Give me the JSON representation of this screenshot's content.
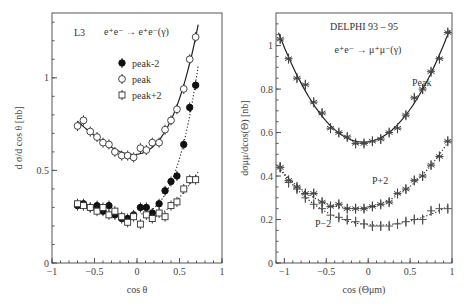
{
  "chart_data": [
    {
      "type": "scatter",
      "panel": "left",
      "experiment_label": "L3",
      "process_label": "e⁺e⁻ → e⁺e⁻(γ)",
      "xlabel": "cos θ",
      "ylabel": "d σ/d cos θ [nb]",
      "xlim": [
        -1,
        1
      ],
      "ylim": [
        0,
        1.35
      ],
      "xticks": [
        "-1",
        "-0.5",
        "0",
        "0.5",
        "1"
      ],
      "yticks": [
        "0",
        "0.5",
        "1"
      ],
      "grid": false,
      "legend": [
        {
          "label": "peak-2",
          "marker": "filled-circle"
        },
        {
          "label": "peak",
          "marker": "open-circle"
        },
        {
          "label": "peak+2",
          "marker": "open-square"
        }
      ],
      "series": [
        {
          "name": "peak",
          "marker": "open-circle",
          "fit": "solid",
          "x": [
            -0.7,
            -0.63,
            -0.55,
            -0.47,
            -0.4,
            -0.33,
            -0.26,
            -0.18,
            -0.11,
            -0.04,
            0.04,
            0.11,
            0.18,
            0.26,
            0.33,
            0.4,
            0.47,
            0.55,
            0.62,
            0.69
          ],
          "y": [
            0.74,
            0.77,
            0.71,
            0.68,
            0.65,
            0.64,
            0.6,
            0.58,
            0.58,
            0.57,
            0.62,
            0.61,
            0.65,
            0.65,
            0.72,
            0.77,
            0.83,
            0.94,
            1.1,
            1.22
          ]
        },
        {
          "name": "peak-2",
          "marker": "filled-circle",
          "fit": "dotted",
          "x": [
            -0.7,
            -0.63,
            -0.55,
            -0.47,
            -0.4,
            -0.33,
            -0.26,
            -0.18,
            -0.11,
            -0.04,
            0.04,
            0.11,
            0.18,
            0.26,
            0.33,
            0.4,
            0.47,
            0.55,
            0.62,
            0.69
          ],
          "y": [
            0.31,
            0.32,
            0.3,
            0.31,
            0.28,
            0.31,
            0.26,
            0.24,
            0.24,
            0.26,
            0.3,
            0.3,
            0.27,
            0.32,
            0.39,
            0.44,
            0.47,
            0.64,
            0.84,
            0.96
          ]
        },
        {
          "name": "peak+2",
          "marker": "open-square",
          "fit": "dotted",
          "x": [
            -0.7,
            -0.63,
            -0.55,
            -0.47,
            -0.4,
            -0.33,
            -0.26,
            -0.18,
            -0.11,
            -0.04,
            0.04,
            0.11,
            0.18,
            0.26,
            0.33,
            0.4,
            0.47,
            0.55,
            0.62,
            0.69
          ],
          "y": [
            0.32,
            0.31,
            0.3,
            0.28,
            0.3,
            0.26,
            0.28,
            0.25,
            0.22,
            0.25,
            0.21,
            0.26,
            0.24,
            0.27,
            0.25,
            0.31,
            0.33,
            0.4,
            0.45,
            0.45
          ]
        }
      ]
    },
    {
      "type": "scatter",
      "panel": "right",
      "experiment_label": "DELPHI 93 – 95",
      "process_label": "e⁺e⁻ → μ⁺μ⁻(γ)",
      "xlabel": "cos (Θμm)",
      "ylabel": "dσμμ/dcos(Θ) [nb]",
      "xlim": [
        -1.1,
        1
      ],
      "ylim": [
        0,
        1.15
      ],
      "xticks": [
        "-1",
        "-0.5",
        "0",
        "0.5",
        "1"
      ],
      "yticks": [
        "0",
        "0.2",
        "0.4",
        "0.6",
        "0.8",
        "1"
      ],
      "grid": false,
      "annotations": [
        "Peak",
        "P+2",
        "P−2"
      ],
      "series": [
        {
          "name": "Peak",
          "marker": "star",
          "fit": "solid",
          "x": [
            -1.05,
            -0.95,
            -0.85,
            -0.75,
            -0.65,
            -0.55,
            -0.45,
            -0.35,
            -0.25,
            -0.15,
            -0.05,
            0.05,
            0.15,
            0.25,
            0.35,
            0.45,
            0.55,
            0.65,
            0.75,
            0.85,
            0.95
          ],
          "y": [
            1.03,
            0.94,
            0.85,
            0.82,
            0.74,
            0.69,
            0.62,
            0.6,
            0.58,
            0.55,
            0.55,
            0.56,
            0.57,
            0.6,
            0.62,
            0.68,
            0.76,
            0.8,
            0.88,
            0.94,
            1.06
          ]
        },
        {
          "name": "P+2",
          "marker": "star",
          "fit": "dotted",
          "x": [
            -1.05,
            -0.95,
            -0.85,
            -0.75,
            -0.65,
            -0.55,
            -0.45,
            -0.35,
            -0.25,
            -0.15,
            -0.05,
            0.05,
            0.15,
            0.25,
            0.35,
            0.45,
            0.55,
            0.65,
            0.75,
            0.85,
            0.95
          ],
          "y": [
            0.44,
            0.38,
            0.35,
            0.32,
            0.32,
            0.28,
            0.26,
            0.27,
            0.25,
            0.25,
            0.25,
            0.26,
            0.27,
            0.28,
            0.32,
            0.34,
            0.38,
            0.4,
            0.45,
            0.49,
            0.56
          ]
        },
        {
          "name": "P-2",
          "marker": "cross",
          "fit": "dotted",
          "x": [
            -1.05,
            -0.95,
            -0.85,
            -0.75,
            -0.65,
            -0.55,
            -0.45,
            -0.35,
            -0.25,
            -0.15,
            -0.05,
            0.05,
            0.15,
            0.25,
            0.35,
            0.45,
            0.55,
            0.65,
            0.75,
            0.85,
            0.95
          ],
          "y": [
            0.44,
            0.37,
            0.34,
            0.3,
            0.27,
            0.25,
            0.22,
            0.21,
            0.2,
            0.19,
            0.18,
            0.17,
            0.17,
            0.17,
            0.18,
            0.19,
            0.2,
            0.2,
            0.24,
            0.25,
            0.25
          ]
        }
      ]
    }
  ]
}
